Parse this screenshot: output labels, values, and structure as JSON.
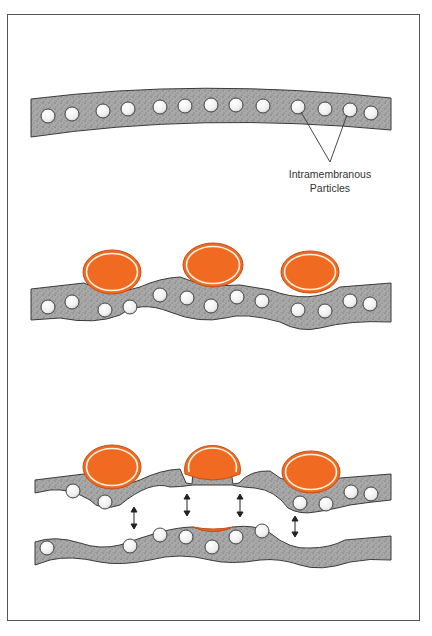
{
  "figure": {
    "colors": {
      "membrane_fill": "#a8a8a8",
      "membrane_outline": "#3a3a3a",
      "particle_fill": "#f4f4f4",
      "vesicle_fill": "#f06a22",
      "vesicle_ring": "#fff4e0",
      "frame": "#555555"
    },
    "panels": [
      {
        "id": "panel-1",
        "caption": "Membrane with intramembranous particles"
      },
      {
        "id": "panel-2",
        "caption": "Vesicles contacting membrane"
      },
      {
        "id": "panel-3",
        "caption": "Fracture of membrane with vesicle fusion sites"
      }
    ],
    "annotations": {
      "particles_label_line1": "Intramembranous",
      "particles_label_line2": "Particles"
    }
  }
}
